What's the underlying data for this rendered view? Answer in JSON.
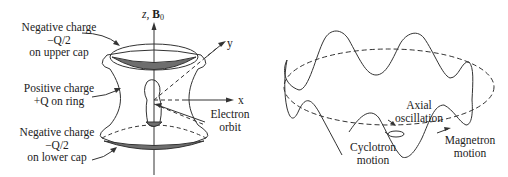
{
  "left_figure": {
    "labels": {
      "upper_cap": [
        "Negative charge",
        "−Q/2",
        "on upper cap"
      ],
      "ring": [
        "Positive charge",
        "+Q on ring"
      ],
      "lower_cap": [
        "Negative charge",
        "−Q/2",
        "on lower cap"
      ],
      "electron_orbit": [
        "Electron",
        "orbit"
      ]
    },
    "axes": {
      "z_label": "z, ",
      "b_label": "B",
      "b_sub": "0",
      "x_label": "x",
      "y_label": "y"
    }
  },
  "right_figure": {
    "labels": {
      "axial": [
        "Axial",
        "oscillation"
      ],
      "cyclotron": [
        "Cyclotron",
        "motion"
      ],
      "magnetron": [
        "Magnetron",
        "motion"
      ]
    }
  },
  "colors": {
    "line": "#333333",
    "fill": "#6e6e6e",
    "background": "#ffffff"
  }
}
